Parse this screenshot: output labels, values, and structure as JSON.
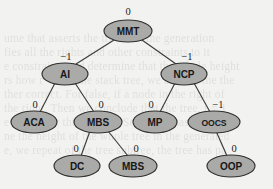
{
  "diagram": {
    "type": "tree",
    "colors": {
      "node_fill": "#aaaaa8",
      "node_stroke": "#2f2f2d",
      "edge_stroke": "#3b3b39",
      "background": "#f2f2f0",
      "text": "#17171a"
    },
    "nodes": [
      {
        "id": "mmt",
        "label": "MMT",
        "weight": "0",
        "cx": 128,
        "cy": 31,
        "rx": 24,
        "ry": 11,
        "weight_x": 128,
        "weight_y": 11,
        "level": 0
      },
      {
        "id": "ai",
        "label": "AI",
        "weight": "−1",
        "cx": 65,
        "cy": 74,
        "rx": 23,
        "ry": 11,
        "weight_x": 66,
        "weight_y": 56,
        "level": 1
      },
      {
        "id": "ncp",
        "label": "NCP",
        "weight": "−1",
        "cx": 184,
        "cy": 74,
        "rx": 23,
        "ry": 11,
        "weight_x": 187,
        "weight_y": 56,
        "level": 1
      },
      {
        "id": "aca",
        "label": "ACA",
        "weight": "0",
        "cx": 34,
        "cy": 122,
        "rx": 23,
        "ry": 11,
        "weight_x": 35,
        "weight_y": 104,
        "level": 2
      },
      {
        "id": "mbs1",
        "label": "MBS",
        "weight": "0",
        "cx": 98,
        "cy": 122,
        "rx": 24,
        "ry": 11,
        "weight_x": 101,
        "weight_y": 104,
        "level": 2
      },
      {
        "id": "mp",
        "label": "MP",
        "weight": "0",
        "cx": 155,
        "cy": 122,
        "rx": 22,
        "ry": 11,
        "weight_x": 151,
        "weight_y": 104,
        "level": 2
      },
      {
        "id": "oocs",
        "label": "OOCS",
        "weight": "−1",
        "cx": 214,
        "cy": 122,
        "rx": 26,
        "ry": 11,
        "weight_x": 218,
        "weight_y": 104,
        "level": 2
      },
      {
        "id": "dc",
        "label": "DC",
        "weight": "0",
        "cx": 77,
        "cy": 166,
        "rx": 23,
        "ry": 11,
        "weight_x": 76,
        "weight_y": 148,
        "level": 3
      },
      {
        "id": "mbs2",
        "label": "MBS",
        "weight": "0",
        "cx": 133,
        "cy": 166,
        "rx": 24,
        "ry": 11,
        "weight_x": 136,
        "weight_y": 148,
        "level": 3
      },
      {
        "id": "oop",
        "label": "OOP",
        "weight": "0",
        "cx": 231,
        "cy": 166,
        "rx": 24,
        "ry": 11,
        "weight_x": 234,
        "weight_y": 148,
        "level": 3
      }
    ],
    "edges": [
      {
        "from": "mmt",
        "to": "ai",
        "weight": "−1",
        "x1": 114,
        "y1": 40,
        "x2": 76,
        "y2": 64
      },
      {
        "from": "mmt",
        "to": "ncp",
        "weight": "−1",
        "x1": 142,
        "y1": 40,
        "x2": 176,
        "y2": 64
      },
      {
        "from": "ai",
        "to": "aca",
        "weight": "0",
        "x1": 55,
        "y1": 83,
        "x2": 40,
        "y2": 112
      },
      {
        "from": "ai",
        "to": "mbs1",
        "weight": "0",
        "x1": 75,
        "y1": 83,
        "x2": 94,
        "y2": 112
      },
      {
        "from": "ncp",
        "to": "mp",
        "weight": "0",
        "x1": 175,
        "y1": 83,
        "x2": 160,
        "y2": 112
      },
      {
        "from": "ncp",
        "to": "oocs",
        "weight": "−1",
        "x1": 194,
        "y1": 83,
        "x2": 210,
        "y2": 112
      },
      {
        "from": "mbs1",
        "to": "dc",
        "weight": "0",
        "x1": 90,
        "y1": 131,
        "x2": 81,
        "y2": 156
      },
      {
        "from": "mbs1",
        "to": "mbs2",
        "weight": "0",
        "x1": 108,
        "y1": 131,
        "x2": 128,
        "y2": 156
      },
      {
        "from": "oocs",
        "to": "oop",
        "weight": "0",
        "x1": 216,
        "y1": 131,
        "x2": 227,
        "y2": 156
      }
    ],
    "background_ghost_lines": [
      {
        "text": "ume that asserts the tree is in the generation",
        "top": 32
      },
      {
        "text": "fies all the rights and other constraints to it",
        "top": 46
      },
      {
        "text": "e constraints and determine that the whole height",
        "top": 60
      },
      {
        "text": "rs how r = 1 in the stack tree, we can see the the",
        "top": 74
      },
      {
        "text": "ther correct. For false, if a node in the right of",
        "top": 88
      },
      {
        "text": "the right. Then we conclude that the tree, r = 1",
        "top": 102
      },
      {
        "text": "e height for this sample. So a node has left re-",
        "top": 116
      },
      {
        "text": "ne the height of the whole tree in the generated",
        "top": 130
      },
      {
        "text": "e, we repeat of the tree subtree, the tree has pa",
        "top": 144
      }
    ]
  }
}
